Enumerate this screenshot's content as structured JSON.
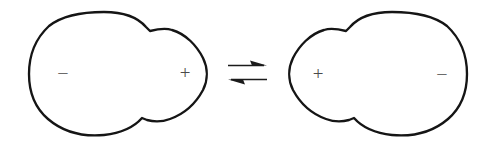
{
  "figure": {
    "caption": "",
    "background_color": "#ffffff",
    "outline_color": "#151515",
    "glyph_color": "#4a4a4a",
    "arrow_color": "#1b1b1b",
    "width": 493,
    "height": 150
  },
  "diagram_data": {
    "type": "diagram",
    "description": "Two mirror-image blob shapes connected by a double equilibrium arrow, each labelled with a negative and a positive charge at opposite ends, indicating reversible polarity switching.",
    "relation_symbol": "equilibrium",
    "states": [
      {
        "id": "state-left",
        "name": "left-blob",
        "wide_lobe_side": "left",
        "narrow_tip_side": "right",
        "labels": [
          {
            "symbol": "−",
            "name": "negative-charge",
            "position": "left",
            "x": 63,
            "y": 73
          },
          {
            "symbol": "+",
            "name": "positive-charge",
            "position": "right",
            "x": 185,
            "y": 72
          }
        ]
      },
      {
        "id": "state-right",
        "name": "right-blob",
        "wide_lobe_side": "right",
        "narrow_tip_side": "left",
        "labels": [
          {
            "symbol": "+",
            "name": "positive-charge",
            "position": "left",
            "x": 318,
            "y": 73
          },
          {
            "symbol": "−",
            "name": "negative-charge",
            "position": "right",
            "x": 442,
            "y": 74
          }
        ]
      }
    ],
    "arrows": [
      {
        "id": "forward-arrow",
        "name": "forward-reaction-arrow",
        "direction": "right",
        "x_start": 228,
        "x_end": 267,
        "y": 65
      },
      {
        "id": "reverse-arrow",
        "name": "reverse-reaction-arrow",
        "direction": "left",
        "x_start": 267,
        "x_end": 228,
        "y": 79
      }
    ]
  }
}
